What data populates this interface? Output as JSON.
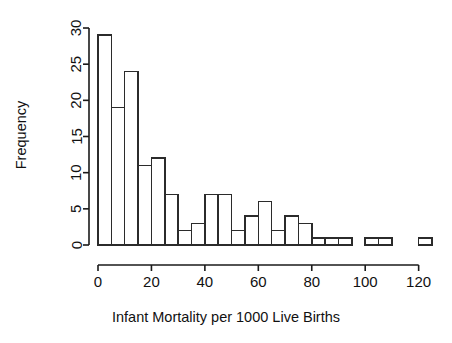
{
  "chart_data": {
    "type": "bar",
    "subtype": "histogram",
    "title": "",
    "subtitle": "",
    "xlabel": "Infant Mortality per 1000 Live Births",
    "ylabel": "Frequency",
    "xlim": [
      0,
      125
    ],
    "ylim": [
      0,
      30
    ],
    "bin_width": 5,
    "grid": false,
    "legend": null,
    "bar_fill_color": "#ffffff",
    "bar_border_color": "#2b2b2b",
    "axis_color": "#1a1a1a",
    "background_color": "#ffffff",
    "x_ticks": [
      0,
      20,
      40,
      60,
      80,
      100,
      120
    ],
    "x_tick_labels": [
      "0",
      "20",
      "40",
      "60",
      "80",
      "100",
      "120"
    ],
    "y_ticks": [
      0,
      5,
      10,
      15,
      20,
      25,
      30
    ],
    "y_tick_labels": [
      "0",
      "5",
      "10",
      "15",
      "20",
      "25",
      "30"
    ],
    "bin_edges": [
      0,
      5,
      10,
      15,
      20,
      25,
      30,
      35,
      40,
      45,
      50,
      55,
      60,
      65,
      70,
      75,
      80,
      85,
      90,
      95,
      100,
      105,
      110,
      115,
      120,
      125
    ],
    "bins": [
      {
        "x0": 0,
        "x1": 5,
        "count": 29
      },
      {
        "x0": 5,
        "x1": 10,
        "count": 19
      },
      {
        "x0": 10,
        "x1": 15,
        "count": 24
      },
      {
        "x0": 15,
        "x1": 20,
        "count": 11
      },
      {
        "x0": 20,
        "x1": 25,
        "count": 12
      },
      {
        "x0": 25,
        "x1": 30,
        "count": 7
      },
      {
        "x0": 30,
        "x1": 35,
        "count": 2
      },
      {
        "x0": 35,
        "x1": 40,
        "count": 3
      },
      {
        "x0": 40,
        "x1": 45,
        "count": 7
      },
      {
        "x0": 45,
        "x1": 50,
        "count": 7
      },
      {
        "x0": 50,
        "x1": 55,
        "count": 2
      },
      {
        "x0": 55,
        "x1": 60,
        "count": 4
      },
      {
        "x0": 60,
        "x1": 65,
        "count": 6
      },
      {
        "x0": 65,
        "x1": 70,
        "count": 2
      },
      {
        "x0": 70,
        "x1": 75,
        "count": 4
      },
      {
        "x0": 75,
        "x1": 80,
        "count": 3
      },
      {
        "x0": 80,
        "x1": 85,
        "count": 1
      },
      {
        "x0": 85,
        "x1": 90,
        "count": 1
      },
      {
        "x0": 90,
        "x1": 95,
        "count": 1
      },
      {
        "x0": 95,
        "x1": 100,
        "count": 0
      },
      {
        "x0": 100,
        "x1": 105,
        "count": 1
      },
      {
        "x0": 105,
        "x1": 110,
        "count": 1
      },
      {
        "x0": 110,
        "x1": 115,
        "count": 0
      },
      {
        "x0": 115,
        "x1": 120,
        "count": 0
      },
      {
        "x0": 120,
        "x1": 125,
        "count": 1
      }
    ],
    "categories": [
      "0-5",
      "5-10",
      "10-15",
      "15-20",
      "20-25",
      "25-30",
      "30-35",
      "35-40",
      "40-45",
      "45-50",
      "50-55",
      "55-60",
      "60-65",
      "65-70",
      "70-75",
      "75-80",
      "80-85",
      "85-90",
      "90-95",
      "95-100",
      "100-105",
      "105-110",
      "110-115",
      "115-120",
      "120-125"
    ],
    "values": [
      29,
      19,
      24,
      11,
      12,
      7,
      2,
      3,
      7,
      7,
      2,
      4,
      6,
      2,
      4,
      3,
      1,
      1,
      1,
      0,
      1,
      1,
      0,
      0,
      1
    ]
  }
}
